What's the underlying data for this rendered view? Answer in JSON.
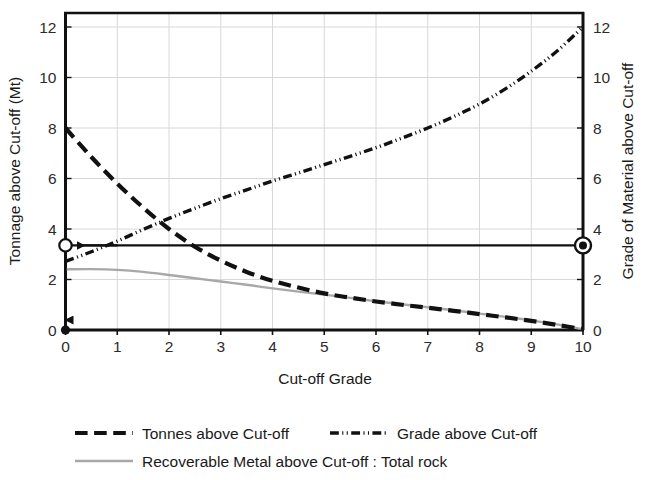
{
  "chart_data": {
    "type": "line",
    "title": "",
    "xlabel": "Cut-off Grade",
    "ylabel": "Tonnage above Cut-off (Mt)",
    "y2label": "Grade of Material above Cut-off",
    "xlim": [
      0,
      10
    ],
    "ylim": [
      0,
      12
    ],
    "y2lim": [
      0,
      12
    ],
    "grid": true,
    "legend_position": "bottom",
    "x_ticks": [
      "0",
      "1",
      "2",
      "3",
      "4",
      "5",
      "6",
      "7",
      "8",
      "9",
      "10"
    ],
    "y_ticks": [
      "0",
      "2",
      "4",
      "6",
      "8",
      "10",
      "12"
    ],
    "y2_ticks": [
      "0",
      "2",
      "4",
      "6",
      "8",
      "10",
      "12"
    ],
    "x": [
      0,
      0.5,
      1,
      1.5,
      2,
      2.5,
      3,
      3.5,
      4,
      4.5,
      5,
      5.5,
      6,
      6.5,
      7,
      7.5,
      8,
      8.5,
      9,
      9.5,
      10
    ],
    "series": [
      {
        "name": "Tonnes above Cut-off",
        "axis": "left",
        "style": "dashed",
        "color": "#111111",
        "width": 4.2,
        "values": [
          8.0,
          6.85,
          5.8,
          4.85,
          4.0,
          3.3,
          2.75,
          2.3,
          1.95,
          1.68,
          1.45,
          1.28,
          1.13,
          1.0,
          0.88,
          0.76,
          0.63,
          0.5,
          0.36,
          0.2,
          0.03
        ]
      },
      {
        "name": "Grade above Cut-off",
        "axis": "right",
        "style": "dash-dot-dot",
        "color": "#111111",
        "width": 3.4,
        "values": [
          2.72,
          3.1,
          3.52,
          3.98,
          4.42,
          4.82,
          5.2,
          5.55,
          5.9,
          6.22,
          6.55,
          6.88,
          7.22,
          7.6,
          8.0,
          8.45,
          8.95,
          9.55,
          10.25,
          11.05,
          12.0
        ]
      },
      {
        "name": "Recoverable Metal above Cut-off : Total rock",
        "axis": "left",
        "style": "solid",
        "color": "#a8a8a8",
        "width": 2.4,
        "values": [
          2.4,
          2.41,
          2.38,
          2.3,
          2.18,
          2.05,
          1.92,
          1.79,
          1.65,
          1.52,
          1.4,
          1.27,
          1.14,
          1.02,
          0.9,
          0.78,
          0.65,
          0.52,
          0.38,
          0.22,
          0.03
        ]
      }
    ],
    "annotations": {
      "reference_line_value": 3.35,
      "left_marker_value": 3.35,
      "right_marker_value": 3.35,
      "origin_marker_value": 0,
      "arrow_to_left_axis": true,
      "arrow_to_origin": true
    }
  },
  "legend": {
    "items": [
      {
        "label": "Tonnes above Cut-off",
        "style": "dashed",
        "color": "#111111"
      },
      {
        "label": "Grade above Cut-off",
        "style": "dash-dot-dot",
        "color": "#111111"
      },
      {
        "label": "Recoverable Metal above Cut-off : Total rock",
        "style": "solid",
        "color": "#a8a8a8"
      }
    ]
  }
}
